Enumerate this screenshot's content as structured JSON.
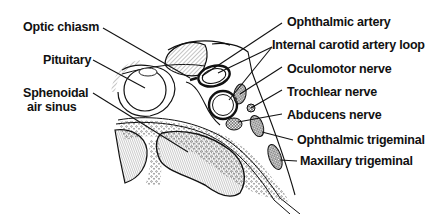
{
  "figure": {
    "colors": {
      "ink": "#111111",
      "background": "#ffffff"
    }
  },
  "labels": {
    "left": [
      {
        "id": "optic-chiasm",
        "text": "Optic chiasm"
      },
      {
        "id": "pituitary",
        "text": "Pituitary"
      },
      {
        "id": "sphenoidal-line1",
        "text": "Sphenoidal"
      },
      {
        "id": "sphenoidal-line2",
        "text": "air sinus"
      }
    ],
    "right": [
      {
        "id": "ophthalmic-artery",
        "text": "Ophthalmic artery"
      },
      {
        "id": "internal-carotid-artery-loop",
        "text": "Internal carotid artery loop"
      },
      {
        "id": "oculomotor-nerve",
        "text": "Oculomotor nerve"
      },
      {
        "id": "trochlear-nerve",
        "text": "Trochlear nerve"
      },
      {
        "id": "abducens-nerve",
        "text": "Abducens nerve"
      },
      {
        "id": "ophthalmic-trigeminal",
        "text": "Ophthalmic trigeminal"
      },
      {
        "id": "maxillary-trigeminal",
        "text": "Maxillary trigeminal"
      }
    ]
  }
}
